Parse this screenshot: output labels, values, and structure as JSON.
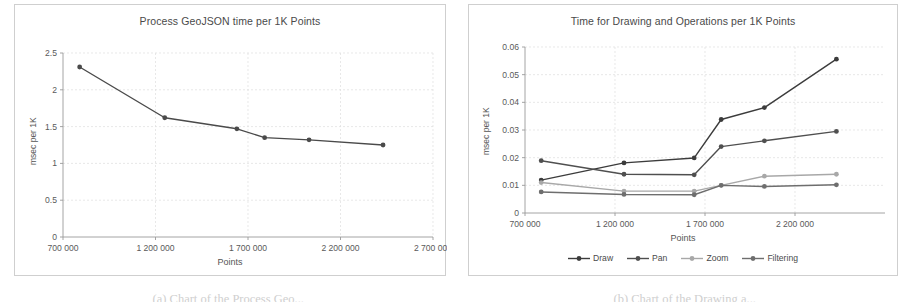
{
  "figure": {
    "caption_left": "(a) Chart of the Process Geo...",
    "caption_right": "(b) Chart of the Drawing a..."
  },
  "charts": [
    {
      "id": "process-geojson",
      "title": "Process GeoJSON time per 1K Points",
      "xlabel": "Points",
      "ylabel": "msec per 1K",
      "legend": []
    },
    {
      "id": "drawing-operations",
      "title": "Time for Drawing and Operations per 1K Points",
      "xlabel": "Points",
      "ylabel": "msec per 1K",
      "legend": [
        "Draw",
        "Pan",
        "Zoom",
        "Filtering"
      ]
    }
  ],
  "chart_data": [
    {
      "type": "line",
      "title": "Process GeoJSON time per 1K Points",
      "xlabel": "Points",
      "ylabel": "msec per 1K",
      "xlim": [
        700000,
        2700000
      ],
      "ylim": [
        0,
        2.5
      ],
      "xticks": [
        700000,
        1200000,
        1700000,
        2200000,
        2700000
      ],
      "xticklabels": [
        "700 000",
        "1 200 000",
        "1 700 000",
        "2 200 000",
        "2 700 000"
      ],
      "yticks": [
        0,
        0.5,
        1,
        1.5,
        2,
        2.5
      ],
      "yticklabels": [
        "0",
        "0.5",
        "1",
        "1.5",
        "2",
        "2.5"
      ],
      "grid": true,
      "legend_position": "none",
      "x": [
        790000,
        1250000,
        1640000,
        1790000,
        2030000,
        2430000
      ],
      "series": [
        {
          "name": "Process GeoJSON",
          "color": "#4a4a4a",
          "values": [
            2.31,
            1.62,
            1.47,
            1.35,
            1.32,
            1.25
          ]
        }
      ]
    },
    {
      "type": "line",
      "title": "Time for Drawing and Operations per 1K Points",
      "xlabel": "Points",
      "ylabel": "msec per 1K",
      "xlim": [
        700000,
        2700000
      ],
      "ylim": [
        0,
        0.06
      ],
      "xticks": [
        700000,
        1200000,
        1700000,
        2200000
      ],
      "xticklabels": [
        "700 000",
        "1 200 000",
        "1 700 000",
        "2 200 000"
      ],
      "yticks": [
        0,
        0.01,
        0.02,
        0.03,
        0.04,
        0.05,
        0.06
      ],
      "yticklabels": [
        "0",
        "0.01",
        "0.02",
        "0.03",
        "0.04",
        "0.05",
        "0.06"
      ],
      "grid": true,
      "legend_position": "bottom",
      "x": [
        790000,
        1250000,
        1640000,
        1790000,
        2030000,
        2430000
      ],
      "series": [
        {
          "name": "Draw",
          "color": "#3c3c3c",
          "values": [
            0.0119,
            0.0181,
            0.0199,
            0.0338,
            0.0381,
            0.0556
          ]
        },
        {
          "name": "Pan",
          "color": "#4f4f4f",
          "values": [
            0.0189,
            0.014,
            0.0138,
            0.024,
            0.0261,
            0.0295
          ]
        },
        {
          "name": "Zoom",
          "color": "#a8a8a8",
          "values": [
            0.011,
            0.0079,
            0.0079,
            0.01,
            0.0133,
            0.014
          ]
        },
        {
          "name": "Filtering",
          "color": "#6e6e6e",
          "values": [
            0.0076,
            0.0067,
            0.0066,
            0.01,
            0.0096,
            0.0102
          ]
        }
      ]
    }
  ]
}
